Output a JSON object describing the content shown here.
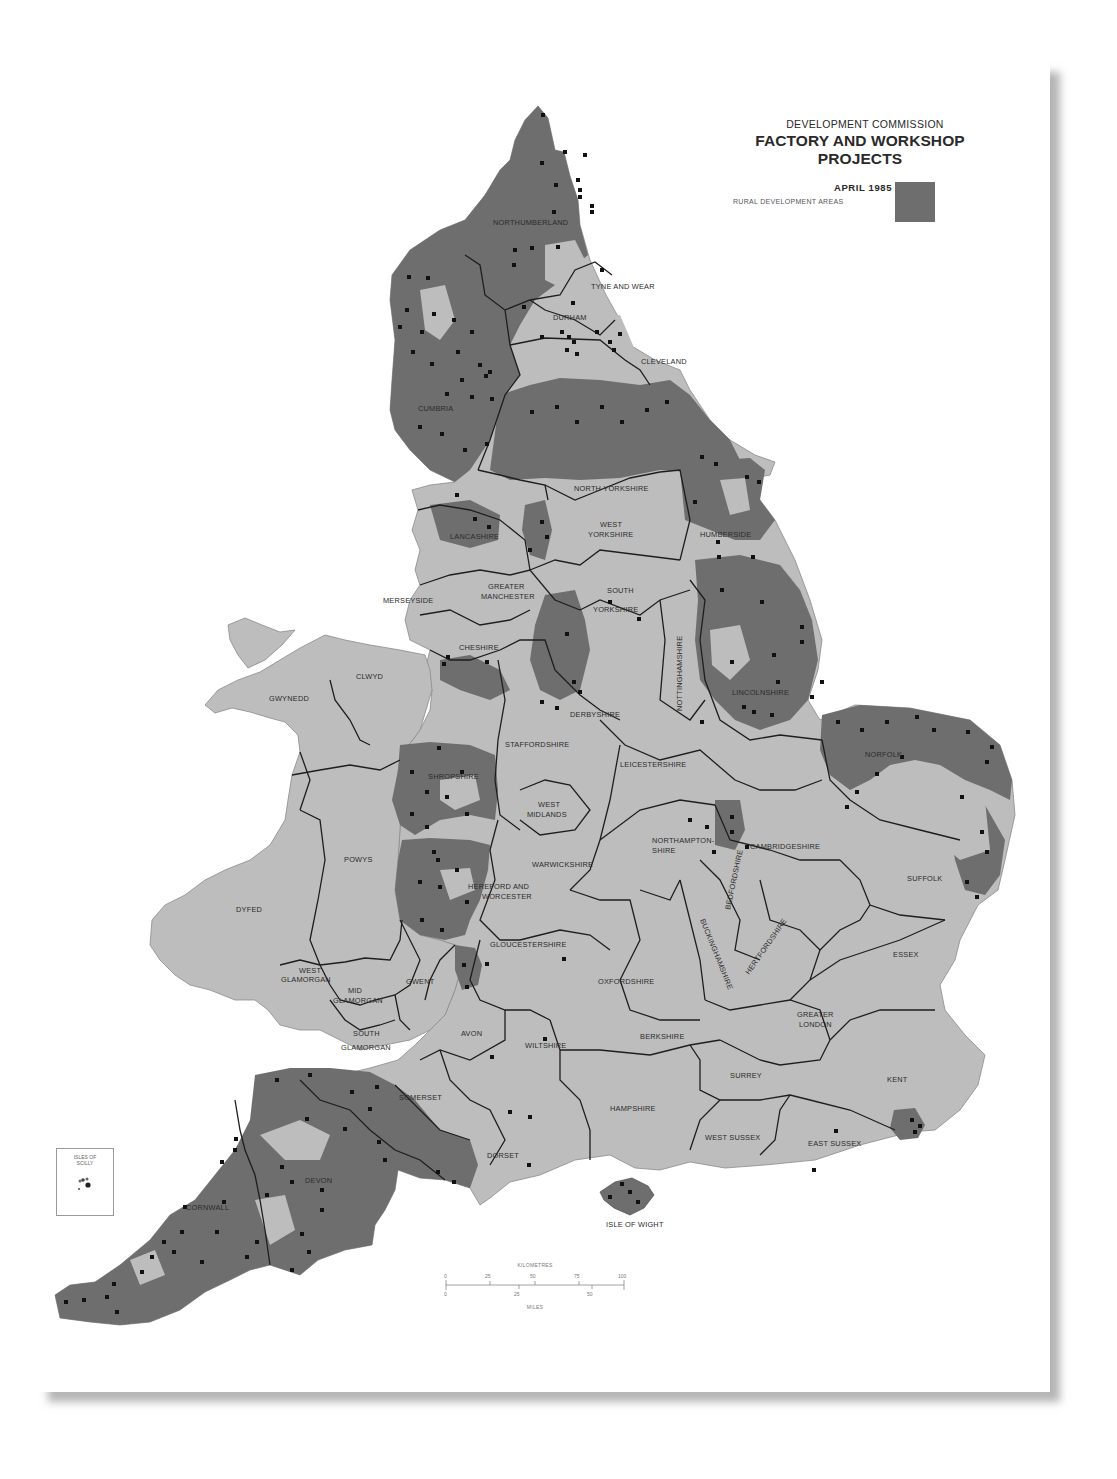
{
  "header": {
    "organisation": "DEVELOPMENT COMMISSION",
    "title": "FACTORY AND WORKSHOP PROJECTS",
    "date": "APRIL 1985"
  },
  "legend": {
    "label": "RURAL DEVELOPMENT AREAS",
    "swatch_color": "#6e6e6e"
  },
  "colors": {
    "land": "#bdbdbd",
    "rural_development_area": "#6e6e6e",
    "boundary": "#1e1e1e",
    "project_marker": "#111111",
    "sea": "#ffffff"
  },
  "inset": {
    "label_line1": "ISLES OF",
    "label_line2": "SCILLY"
  },
  "scale_bar": {
    "kilometres_label": "KILOMETRES",
    "miles_label": "MILES",
    "km_ticks": [
      "0",
      "25",
      "50",
      "75",
      "100"
    ],
    "mile_ticks": [
      "0",
      "25",
      "50"
    ]
  },
  "counties": [
    {
      "name": "NORTHUMBERLAND",
      "x": 493,
      "y": 225
    },
    {
      "name": "TYNE AND WEAR",
      "x": 591,
      "y": 289
    },
    {
      "name": "DURHAM",
      "x": 553,
      "y": 320
    },
    {
      "name": "CLEVELAND",
      "x": 641,
      "y": 364
    },
    {
      "name": "CUMBRIA",
      "x": 418,
      "y": 411
    },
    {
      "name": "NORTH YORKSHIRE",
      "x": 574,
      "y": 491
    },
    {
      "name": "HUMBERSIDE",
      "x": 700,
      "y": 537
    },
    {
      "name": "LANCASHIRE",
      "x": 450,
      "y": 539
    },
    {
      "name": "WEST",
      "x": 600,
      "y": 527
    },
    {
      "name": "YORKSHIRE",
      "x": 588,
      "y": 537
    },
    {
      "name": "GREATER",
      "x": 488,
      "y": 589
    },
    {
      "name": "MANCHESTER",
      "x": 481,
      "y": 599
    },
    {
      "name": "MERSEYSIDE",
      "x": 383,
      "y": 603
    },
    {
      "name": "SOUTH",
      "x": 607,
      "y": 593
    },
    {
      "name": "YORKSHIRE",
      "x": 593,
      "y": 612
    },
    {
      "name": "CHESHIRE",
      "x": 459,
      "y": 650
    },
    {
      "name": "CLWYD",
      "x": 356,
      "y": 679
    },
    {
      "name": "GWYNEDD",
      "x": 269,
      "y": 701
    },
    {
      "name": "LINCOLNSHIRE",
      "x": 732,
      "y": 695
    },
    {
      "name": "DERBYSHIRE",
      "x": 570,
      "y": 717
    },
    {
      "name": "STAFFORDSHIRE",
      "x": 505,
      "y": 747
    },
    {
      "name": "NORFOLK",
      "x": 865,
      "y": 757
    },
    {
      "name": "LEICESTERSHIRE",
      "x": 620,
      "y": 767
    },
    {
      "name": "SHROPSHIRE",
      "x": 428,
      "y": 779
    },
    {
      "name": "WEST",
      "x": 538,
      "y": 807
    },
    {
      "name": "MIDLANDS",
      "x": 527,
      "y": 817
    },
    {
      "name": "NORTHAMPTON-",
      "x": 652,
      "y": 843
    },
    {
      "name": "SHIRE",
      "x": 652,
      "y": 853
    },
    {
      "name": "CAMBRIDGESHIRE",
      "x": 750,
      "y": 849
    },
    {
      "name": "POWYS",
      "x": 344,
      "y": 862
    },
    {
      "name": "WARWICKSHIRE",
      "x": 532,
      "y": 867
    },
    {
      "name": "SUFFOLK",
      "x": 907,
      "y": 881
    },
    {
      "name": "HEREFORD AND",
      "x": 468,
      "y": 889
    },
    {
      "name": "WORCESTER",
      "x": 482,
      "y": 899
    },
    {
      "name": "DYFED",
      "x": 236,
      "y": 912
    },
    {
      "name": "GLOUCESTERSHIRE",
      "x": 490,
      "y": 947
    },
    {
      "name": "ESSEX",
      "x": 893,
      "y": 957
    },
    {
      "name": "OXFORDSHIRE",
      "x": 598,
      "y": 984
    },
    {
      "name": "WEST",
      "x": 299,
      "y": 973
    },
    {
      "name": "GLAMORGAN",
      "x": 281,
      "y": 982
    },
    {
      "name": "GWENT",
      "x": 406,
      "y": 984
    },
    {
      "name": "MID",
      "x": 348,
      "y": 993
    },
    {
      "name": "GLAMORGAN",
      "x": 333,
      "y": 1003
    },
    {
      "name": "GREATER",
      "x": 797,
      "y": 1017
    },
    {
      "name": "LONDON",
      "x": 799,
      "y": 1027
    },
    {
      "name": "AVON",
      "x": 461,
      "y": 1036
    },
    {
      "name": "WILTSHIRE",
      "x": 525,
      "y": 1048
    },
    {
      "name": "BERKSHIRE",
      "x": 640,
      "y": 1039
    },
    {
      "name": "SOUTH",
      "x": 353,
      "y": 1036
    },
    {
      "name": "GLAMORGAN",
      "x": 341,
      "y": 1050
    },
    {
      "name": "SURREY",
      "x": 730,
      "y": 1078
    },
    {
      "name": "KENT",
      "x": 887,
      "y": 1082
    },
    {
      "name": "SOMERSET",
      "x": 399,
      "y": 1100
    },
    {
      "name": "HAMPSHIRE",
      "x": 610,
      "y": 1111
    },
    {
      "name": "WEST SUSSEX",
      "x": 705,
      "y": 1140
    },
    {
      "name": "EAST SUSSEX",
      "x": 808,
      "y": 1146
    },
    {
      "name": "DEVON",
      "x": 305,
      "y": 1183
    },
    {
      "name": "DORSET",
      "x": 487,
      "y": 1158
    },
    {
      "name": "CORNWALL",
      "x": 186,
      "y": 1210
    },
    {
      "name": "ISLE OF WIGHT",
      "x": 606,
      "y": 1227
    }
  ],
  "rotated_counties": [
    {
      "name": "NOTTINGHAMSHIRE",
      "x": 682,
      "y": 711,
      "rotate": -90
    },
    {
      "name": "BEDFORDSHIRE",
      "x": 730,
      "y": 910,
      "rotate": -78
    },
    {
      "name": "BUCKINGHAMSHIRE",
      "x": 700,
      "y": 920,
      "rotate": 68
    },
    {
      "name": "HERTFORDSHIRE",
      "x": 749,
      "y": 975,
      "rotate": -55
    }
  ]
}
